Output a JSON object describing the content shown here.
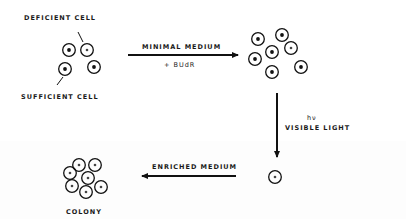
{
  "labels": {
    "deficient_cell": "DEFICIENT CELL",
    "sufficient_cell": "SUFFICIENT CELL",
    "minimal_medium": "MINIMAL MEDIUM",
    "budr": "+ BUdR",
    "hv": "hν",
    "visible_light": "VISIBLE LIGHT",
    "enriched_medium": "ENRICHED MEDIUM",
    "colony": "COLONY"
  },
  "stages": [
    {
      "name": "initial-mixture",
      "cells": [
        {
          "x": 69,
          "y": 50,
          "type": "sufficient"
        },
        {
          "x": 87,
          "y": 50,
          "type": "deficient"
        },
        {
          "x": 65,
          "y": 69,
          "type": "sufficient"
        },
        {
          "x": 94,
          "y": 67,
          "type": "sufficient"
        }
      ]
    },
    {
      "name": "after-growth",
      "cells": [
        {
          "x": 258,
          "y": 39,
          "type": "sufficient"
        },
        {
          "x": 282,
          "y": 35,
          "type": "sufficient"
        },
        {
          "x": 272,
          "y": 52,
          "type": "sufficient"
        },
        {
          "x": 291,
          "y": 48,
          "type": "deficient"
        },
        {
          "x": 255,
          "y": 59,
          "type": "sufficient"
        },
        {
          "x": 272,
          "y": 72,
          "type": "sufficient"
        },
        {
          "x": 301,
          "y": 67,
          "type": "sufficient"
        }
      ]
    },
    {
      "name": "survivor",
      "cells": [
        {
          "x": 275,
          "y": 177,
          "type": "deficient"
        }
      ]
    },
    {
      "name": "colony",
      "cells": [
        {
          "x": 79,
          "y": 165,
          "type": "deficient"
        },
        {
          "x": 95,
          "y": 165,
          "type": "deficient"
        },
        {
          "x": 70,
          "y": 173,
          "type": "deficient"
        },
        {
          "x": 88,
          "y": 178,
          "type": "deficient"
        },
        {
          "x": 72,
          "y": 186,
          "type": "deficient"
        },
        {
          "x": 86,
          "y": 192,
          "type": "deficient"
        },
        {
          "x": 101,
          "y": 187,
          "type": "deficient"
        }
      ]
    }
  ],
  "colors": {
    "ink": "#111111",
    "background": "#ffffff"
  }
}
